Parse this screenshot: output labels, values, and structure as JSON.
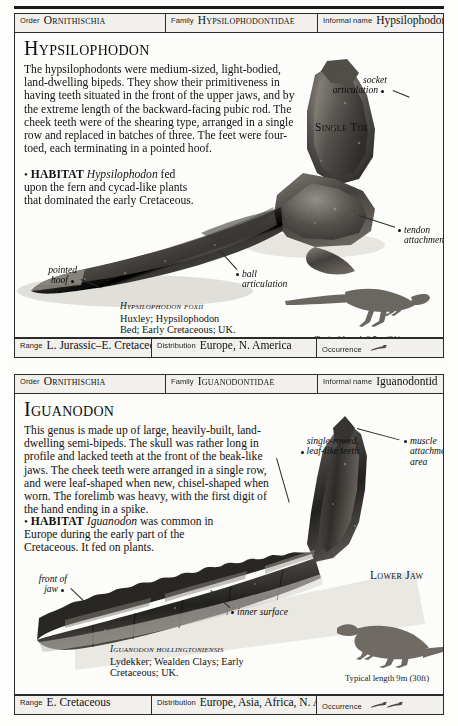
{
  "document": {
    "title": "Hypsilophodon and Iguanodon fact-file page",
    "ink_color": "#111111",
    "paper_color": "#fdfdfb"
  },
  "entries": [
    {
      "header": {
        "order_label": "Order",
        "order_value": "Ornithischia",
        "family_label": "Family",
        "family_value": "Hypsilophodontidae",
        "informal_label": "Informal name",
        "informal_value": "Hypsilophodontid"
      },
      "title": "Hypsilophodon",
      "intro": "The hypsilophodonts were medium-sized, light-bodied, land-dwelling bipeds. They show their primitiveness in having teeth situated in the front of the upper jaws, and by the extreme length of the backward-facing pubic rod. The cheek teeth were of the shearing type, arranged in a single row and replaced in batches of three. The feet were four-toed, each terminating in a pointed hoof.",
      "habitat_bullet": "•",
      "habitat_label": "HABITAT",
      "habitat_genus": "Hypsilophodon",
      "habitat_text": "fed upon the fern and cycad-like plants that dominated the early Cretaceous.",
      "specimen": {
        "name": "Hypsilophodon foxii",
        "line2": "Huxley; Hypsilophodon",
        "line3": "Bed; Early Cretaceous; UK."
      },
      "side_label": "Single Toe",
      "annotations": [
        {
          "name": "socket-articulation",
          "text_lines": [
            "socket",
            "articulation"
          ]
        },
        {
          "name": "tendon-attachment",
          "text_lines": [
            "tendon",
            "attachment"
          ]
        },
        {
          "name": "ball-articulation",
          "text_lines": [
            "ball",
            "articulation"
          ]
        },
        {
          "name": "pointed-hoof",
          "text_lines": [
            "pointed",
            "hoof"
          ]
        }
      ],
      "scale": {
        "caption": "Typical length 2.5m (8ft)"
      },
      "footer": {
        "range_label": "Range",
        "range_value": "L. Jurassic–E. Cretaceous",
        "distribution_label": "Distribution",
        "distribution_value": "Europe, N. America",
        "occurrence_label": "Occurrence",
        "occurrence_icon": "bone-icon",
        "occurrence_count": 1
      }
    },
    {
      "header": {
        "order_label": "Order",
        "order_value": "Ornithischia",
        "family_label": "Family",
        "family_value": "Iguanodontidae",
        "informal_label": "Informal name",
        "informal_value": "Iguanodontid"
      },
      "title": "Iguanodon",
      "intro": "This genus is made up of large, heavily-built, land-dwelling semi-bipeds. The skull was rather long in profile and lacked teeth at the front of the beak-like jaws. The cheek teeth were arranged in a single row, and were leaf-shaped when new, chisel-shaped when worn. The forelimb was heavy, with the first digit of the hand ending in a spike.",
      "habitat_bullet": "•",
      "habitat_label": "HABITAT",
      "habitat_genus": "Iguanodon",
      "habitat_text": "was common in Europe during the early part of the Cretaceous. It fed on plants.",
      "specimen": {
        "name": "Iguanodon hollingtoniensis",
        "line2": "Lydekker; Wealden Clays; Early",
        "line3": "Cretaceous; UK."
      },
      "side_label": "Lower Jaw",
      "annotations": [
        {
          "name": "single-rowed-leaf-like-teeth",
          "text_lines": [
            "single-rowed,",
            "leaf-like teeth"
          ]
        },
        {
          "name": "muscle-attachment-area",
          "text_lines": [
            "muscle",
            "attachment",
            "area"
          ]
        },
        {
          "name": "front-of-jaw",
          "text_lines": [
            "front of",
            "jaw"
          ]
        },
        {
          "name": "inner-surface",
          "text_lines": [
            "inner surface"
          ]
        }
      ],
      "scale": {
        "caption": "Typical length 9m (30ft)"
      },
      "footer": {
        "range_label": "Range",
        "range_value": "E. Cretaceous",
        "distribution_label": "Distribution",
        "distribution_value": "Europe, Asia, Africa, N. America",
        "occurrence_label": "Occurrence",
        "occurrence_icon": "bone-icon",
        "occurrence_count": 2
      }
    }
  ]
}
